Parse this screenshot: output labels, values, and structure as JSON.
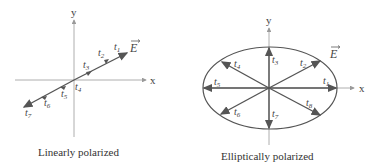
{
  "colors": {
    "axis": "#9a9a9a",
    "vector": "#555555",
    "ellipse": "#555555",
    "text": "#444444"
  },
  "diagrams": [
    {
      "id": "linear",
      "caption": "Linearly polarized",
      "axes": {
        "x_label": "x",
        "y_label": "y"
      },
      "field_label": "E",
      "time_labels": [
        "t1",
        "t2",
        "t3",
        "t4",
        "t5",
        "t6",
        "t7"
      ]
    },
    {
      "id": "elliptical",
      "caption": "Elliptically polarized",
      "axes": {
        "x_label": "x",
        "y_label": "y"
      },
      "field_label": "E",
      "time_labels": [
        "t1",
        "t2",
        "t3",
        "t4",
        "t5",
        "t6",
        "t7",
        "t8"
      ]
    }
  ]
}
